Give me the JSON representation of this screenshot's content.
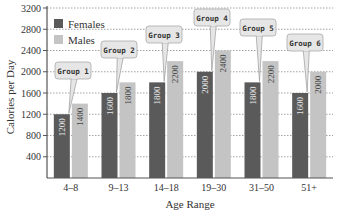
{
  "chart_data": {
    "type": "bar",
    "title": "",
    "xlabel": "Age Range",
    "ylabel": "Calories per Day",
    "ylim": [
      0,
      3200
    ],
    "yticks": [
      400,
      800,
      1200,
      1600,
      2000,
      2400,
      2800,
      3200
    ],
    "grid": true,
    "legend_position": "top-left",
    "categories": [
      "4–8",
      "9–13",
      "14–18",
      "19–30",
      "31–50",
      "51+"
    ],
    "series": [
      {
        "name": "Females",
        "color": "#5a5a5a",
        "values": [
          1200,
          1600,
          1800,
          2000,
          1800,
          1600
        ]
      },
      {
        "name": "Males",
        "color": "#c4c4c4",
        "values": [
          1400,
          1800,
          2200,
          2400,
          2200,
          2000
        ]
      }
    ],
    "annotations": [
      "Group 1",
      "Group 2",
      "Group 3",
      "Group 4",
      "Group 5",
      "Group 6"
    ]
  }
}
